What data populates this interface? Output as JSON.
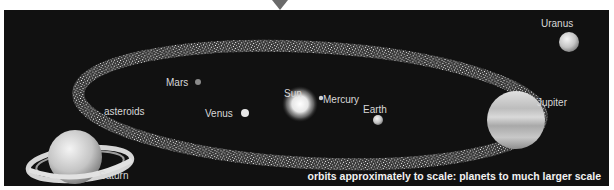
{
  "diagram": {
    "caption": "orbits approximately to scale: planets to much larger scale",
    "bodies": [
      {
        "name": "Sun",
        "label": "Sun"
      },
      {
        "name": "Mercury",
        "label": "Mercury"
      },
      {
        "name": "Venus",
        "label": "Venus"
      },
      {
        "name": "Earth",
        "label": "Earth"
      },
      {
        "name": "Mars",
        "label": "Mars"
      },
      {
        "name": "Asteroids",
        "label": "asteroids"
      },
      {
        "name": "Jupiter",
        "label": "Jupiter"
      },
      {
        "name": "Saturn",
        "label": "Saturn"
      },
      {
        "name": "Uranus",
        "label": "Uranus"
      }
    ],
    "colors": {
      "background": "#111111",
      "label": "#d8d8d8",
      "caption": "#f2f2f2"
    }
  }
}
